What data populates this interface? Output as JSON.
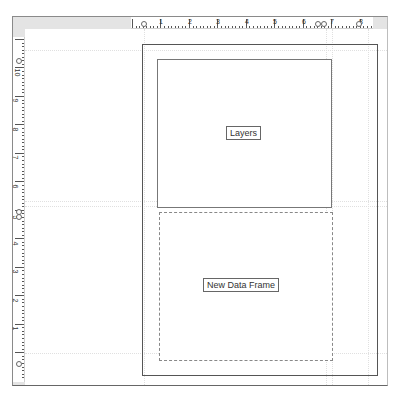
{
  "layout_view": {
    "top_ruler": {
      "labels": [
        "1",
        "2",
        "3",
        "4",
        "5",
        "6",
        "7",
        "8"
      ],
      "unit": "inches"
    },
    "left_ruler": {
      "labels": [
        "10",
        "9",
        "8",
        "7",
        "6",
        "5",
        "4",
        "3",
        "2",
        "1"
      ],
      "unit": "inches"
    },
    "page": {
      "data_frames": [
        {
          "name": "Layers",
          "active": false
        },
        {
          "name": "New Data Frame",
          "active": true
        }
      ]
    }
  },
  "colors": {
    "ruler_background": "#e4e4e4",
    "page_border": "#555555",
    "frame_border": "#777777"
  }
}
